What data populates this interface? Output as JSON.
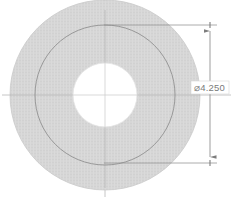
{
  "drawing": {
    "title": "Annular disc section view",
    "background_color": "#ffffff",
    "geometry": {
      "center": {
        "x": 105,
        "y": 95
      },
      "outer_disc": {
        "label": "outer-disc",
        "radius": 95,
        "fill_color": "#d6d6d6",
        "stroke_color": "#c2c2c2"
      },
      "construction_circle": {
        "label": "construction-circle",
        "radius": 70,
        "stroke_color": "#8d8d8d"
      },
      "center_hole": {
        "label": "center-hole",
        "radius": 32,
        "fill_color": "#ffffff",
        "stroke_color": "#e2e2e2"
      }
    },
    "centerlines": {
      "color": "#b9b9b9",
      "horizontal": {
        "x1": 2,
        "x2": 231,
        "y": 95
      },
      "vertical": {
        "x": 105,
        "y1": 2,
        "y2": 197
      }
    },
    "dimension": {
      "name": "diameter-dimension",
      "symbol": "⌀",
      "value": "4.250",
      "text": "⌀4.250",
      "text_color": "#7a7a7a",
      "line_color": "#8d8d8d",
      "dimension_line_x": 210,
      "arrow_top_y": 25,
      "arrow_bottom_y": 163,
      "extension_top": {
        "x1": 104,
        "x2": 216,
        "y": 25
      },
      "extension_bottom": {
        "x1": 104,
        "x2": 216,
        "y": 163
      },
      "text_position": {
        "x": 194,
        "y": 88
      }
    }
  }
}
